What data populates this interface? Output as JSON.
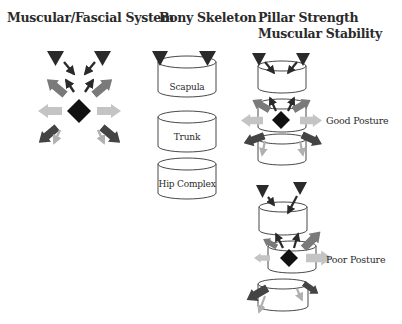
{
  "titles": {
    "muscular": "Muscular/Fascial System",
    "bony": "Bony Skeleton",
    "pillar_line1": "Pillar Strength",
    "pillar_line2": "Muscular Stability"
  },
  "bony_segments": [
    {
      "label": "Scapula"
    },
    {
      "label": "Trunk"
    },
    {
      "label": "Hip Complex"
    }
  ],
  "posture_labels": {
    "good": "Good Posture",
    "poor": "Poor Posture"
  },
  "colors": {
    "dark": "#2a2a2a",
    "mid": "#7a7a7a",
    "light": "#c4c4c4",
    "black": "#111111"
  }
}
